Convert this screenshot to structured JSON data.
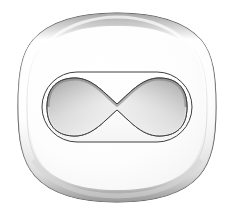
{
  "figure": {
    "canvas": {
      "width": 235,
      "height": 215,
      "background_color": "#ffffff"
    },
    "shapes": {
      "outer_body": {
        "label": "cell body",
        "shape_type": "rounded-squircle",
        "bounds": {
          "x": 18,
          "y": 13,
          "width": 198,
          "height": 189
        },
        "fill_color": "#fbfbfb",
        "stroke_color": "#4a4a4a",
        "stroke_width": 1.1,
        "rim_highlight_color": "#ffffff",
        "rim_shadow_color": "#c9c9c9"
      },
      "inner_capsule": {
        "label": "stadium outline",
        "shape_type": "stadium",
        "bounds": {
          "x": 42,
          "y": 72,
          "width": 150,
          "height": 70
        },
        "corner_radius": 35,
        "fill_color": "#fdfdfd",
        "stroke_color": "#3f3f3f",
        "stroke_width": 1.0
      },
      "hourglass": {
        "label": "bowtie inclusion",
        "shape_type": "hourglass",
        "bounds": {
          "x": 46,
          "y": 78,
          "width": 142,
          "height": 58
        },
        "waist_x": 117,
        "waist_height": 6,
        "lobe_height": 56,
        "fill_gradient_light": "#fafafa",
        "fill_gradient_mid": "#c4c4c4",
        "fill_gradient_dark": "#8e8e8e",
        "stroke_color": "#3a3a3a",
        "stroke_width": 1.0
      }
    },
    "palette": {
      "background": "#ffffff",
      "outline_dark": "#3a3a3a",
      "outline_mid": "#6e6e6e",
      "shade_light": "#f2f2f2",
      "shade_mid": "#c4c4c4",
      "shade_dark": "#8e8e8e"
    }
  }
}
